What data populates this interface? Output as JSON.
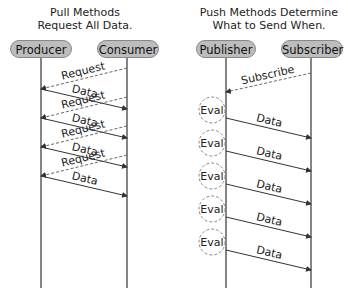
{
  "left": {
    "title_line1": "Pull Methods",
    "title_line2": "Request All Data.",
    "actors": [
      "Producer",
      "Consumer"
    ],
    "messages": [
      {
        "label": "Request",
        "style": "dashed",
        "direction": "consumer-to-producer"
      },
      {
        "label": "Data",
        "style": "solid",
        "direction": "producer-to-consumer"
      },
      {
        "label": "Request",
        "style": "dashed",
        "direction": "consumer-to-producer"
      },
      {
        "label": "Data",
        "style": "solid",
        "direction": "producer-to-consumer"
      },
      {
        "label": "Request",
        "style": "dashed",
        "direction": "consumer-to-producer"
      },
      {
        "label": "Data",
        "style": "solid",
        "direction": "producer-to-consumer"
      },
      {
        "label": "Request",
        "style": "dashed",
        "direction": "consumer-to-producer"
      },
      {
        "label": "Data",
        "style": "solid",
        "direction": "producer-to-consumer"
      }
    ]
  },
  "right": {
    "title_line1": "Push Methods Determine",
    "title_line2": "What to Send When.",
    "actors": [
      "Publisher",
      "Subscriber"
    ],
    "subscribe_label": "Subscribe",
    "eval_label": "Eval",
    "data_label": "Data",
    "eval_count": 5
  },
  "colors": {
    "actor_fill": "#bdbdbd",
    "line": "#333333",
    "dashed": "#666666"
  }
}
